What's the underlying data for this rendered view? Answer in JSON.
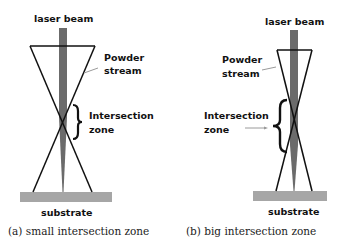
{
  "panels": [
    {
      "id": "a",
      "laser_label": "laser beam",
      "powder_label_line1": "Powder",
      "powder_label_line2": "stream",
      "zone_label_line1": "Intersection",
      "zone_label_line2": "zone",
      "substrate_label": "substrate",
      "caption": "(a) small intersection zone"
    },
    {
      "id": "b",
      "laser_label": "laser beam",
      "powder_label_line1": "Powder",
      "powder_label_line2": "stream",
      "zone_label_line1": "Intersection",
      "zone_label_line2": "zone",
      "substrate_label": "substrate",
      "caption": "(b) big intersection zone"
    }
  ],
  "colors": {
    "beam": "#6b6b6b",
    "substrate": "#a6a6a6",
    "lines": "#111111",
    "arrow": "#9a9a9a"
  }
}
